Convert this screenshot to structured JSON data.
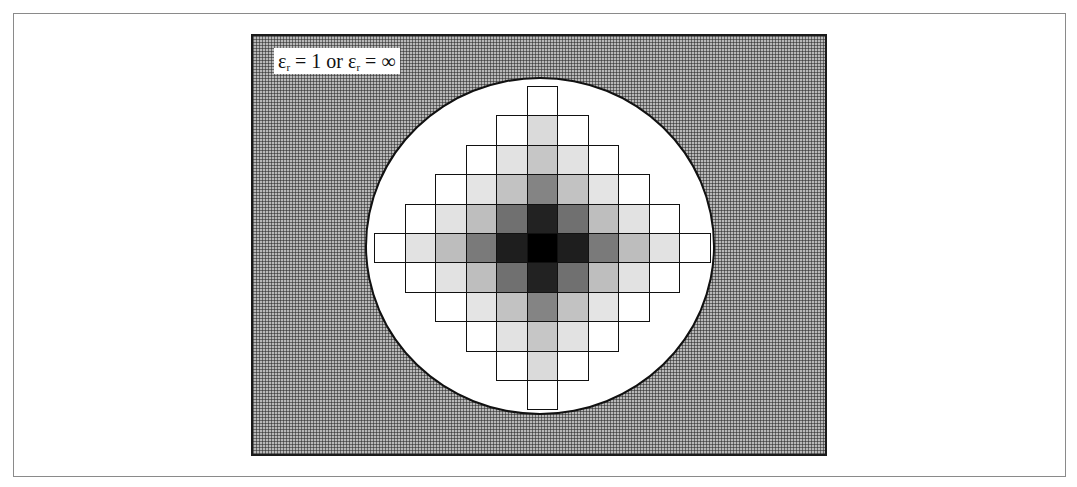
{
  "figure": {
    "label": {
      "prefix": "ε",
      "sub1": "r",
      "mid": " = 1 or ε",
      "sub2": "r",
      "suffix": " = ∞",
      "full_text": "εr = 1 or εr = ∞"
    },
    "background_region": "dotted medium-gray exterior (εr = 1 or εr = ∞)",
    "circle_fill": "#ffffff",
    "grid": {
      "rows": 11,
      "cols": 11,
      "shape": "diamond",
      "cell_width": 30.5,
      "cell_height": 29.4,
      "origin_x": 121,
      "origin_y": 50,
      "shade_by_abs_offset": {
        "0,0": "#000000",
        "0,1": "#1e1e1e",
        "1,0": "#222222",
        "0,2": "#7a7a7a",
        "2,0": "#848484",
        "1,1": "#707070",
        "0,3": "#bdbdbd",
        "3,0": "#c6c6c6",
        "1,2": "#bebebe",
        "2,1": "#c2c2c2",
        "0,4": "#e2e2e2",
        "4,0": "#dadada",
        "1,3": "#e2e2e2",
        "3,1": "#e2e2e2",
        "2,2": "#e4e4e4",
        "default": "#ffffff"
      }
    }
  }
}
